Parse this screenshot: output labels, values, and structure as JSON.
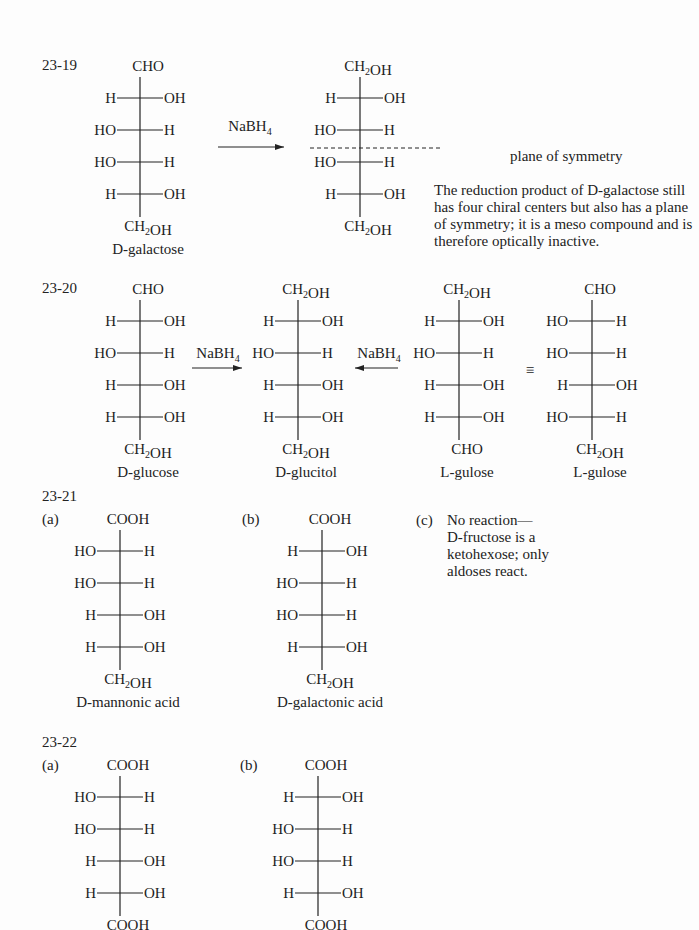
{
  "problems": [
    {
      "id": "23-19",
      "structures": [
        {
          "name": "D-galactose",
          "top": "CHO",
          "bottom": "CH2OH",
          "rows": [
            [
              "H",
              "OH"
            ],
            [
              "HO",
              "H"
            ],
            [
              "HO",
              "H"
            ],
            [
              "H",
              "OH"
            ]
          ],
          "label": "D-galactose"
        },
        {
          "name": "galactitol",
          "top": "CH2OH",
          "bottom": "CH2OH",
          "rows": [
            [
              "H",
              "OH"
            ],
            [
              "HO",
              "H"
            ],
            [
              "HO",
              "H"
            ],
            [
              "H",
              "OH"
            ]
          ],
          "label": ""
        }
      ],
      "reagent": "NaBH4",
      "symmetry_label": "plane of symmetry",
      "note": "The reduction product of D-galactose still has four chiral centers but also has a plane of symmetry; it is a meso compound and is therefore optically inactive."
    },
    {
      "id": "23-20",
      "structures": [
        {
          "top": "CHO",
          "bottom": "CH2OH",
          "rows": [
            [
              "H",
              "OH"
            ],
            [
              "HO",
              "H"
            ],
            [
              "H",
              "OH"
            ],
            [
              "H",
              "OH"
            ]
          ],
          "label": "D-glucose"
        },
        {
          "top": "CH2OH",
          "bottom": "CH2OH",
          "rows": [
            [
              "H",
              "OH"
            ],
            [
              "HO",
              "H"
            ],
            [
              "H",
              "OH"
            ],
            [
              "H",
              "OH"
            ]
          ],
          "label": "D-glucitol"
        },
        {
          "top": "CH2OH",
          "bottom": "CHO",
          "rows": [
            [
              "H",
              "OH"
            ],
            [
              "HO",
              "H"
            ],
            [
              "H",
              "OH"
            ],
            [
              "H",
              "OH"
            ]
          ],
          "label": "L-gulose"
        },
        {
          "top": "CHO",
          "bottom": "CH2OH",
          "rows": [
            [
              "HO",
              "H"
            ],
            [
              "HO",
              "H"
            ],
            [
              "H",
              "OH"
            ],
            [
              "HO",
              "H"
            ]
          ],
          "label": "L-gulose"
        }
      ],
      "reagent_left": "NaBH4",
      "reagent_right": "NaBH4",
      "equiv_symbol": "≡"
    },
    {
      "id": "23-21",
      "parts": [
        {
          "letter": "(a)",
          "top": "COOH",
          "bottom": "CH2OH",
          "rows": [
            [
              "HO",
              "H"
            ],
            [
              "HO",
              "H"
            ],
            [
              "H",
              "OH"
            ],
            [
              "H",
              "OH"
            ]
          ],
          "label": "D-mannonic acid"
        },
        {
          "letter": "(b)",
          "top": "COOH",
          "bottom": "CH2OH",
          "rows": [
            [
              "H",
              "OH"
            ],
            [
              "HO",
              "H"
            ],
            [
              "HO",
              "H"
            ],
            [
              "H",
              "OH"
            ]
          ],
          "label": "D-galactonic acid"
        },
        {
          "letter": "(c)",
          "text": [
            "No reaction—",
            "D-fructose is a",
            "ketohexose; only",
            "aldoses react."
          ]
        }
      ]
    },
    {
      "id": "23-22",
      "parts": [
        {
          "letter": "(a)",
          "top": "COOH",
          "bottom": "COOH",
          "rows": [
            [
              "HO",
              "H"
            ],
            [
              "HO",
              "H"
            ],
            [
              "H",
              "OH"
            ],
            [
              "H",
              "OH"
            ]
          ]
        },
        {
          "letter": "(b)",
          "top": "COOH",
          "bottom": "COOH",
          "rows": [
            [
              "H",
              "OH"
            ],
            [
              "HO",
              "H"
            ],
            [
              "HO",
              "H"
            ],
            [
              "H",
              "OH"
            ]
          ]
        }
      ]
    }
  ]
}
